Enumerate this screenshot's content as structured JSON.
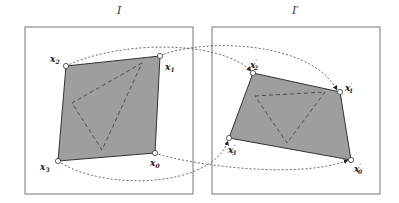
{
  "diagram": {
    "left_image": {
      "title": "I",
      "box": [
        25,
        27,
        193,
        194
      ]
    },
    "right_image": {
      "title": "I′",
      "box": [
        212,
        27,
        380,
        194
      ]
    },
    "colors": {
      "quad_fill": "#9e9e9e",
      "stroke": "#333333",
      "frame": "#777777",
      "dashed": "#444444"
    },
    "left_points": [
      {
        "label": "x",
        "sub": "0",
        "x": 155,
        "y": 153
      },
      {
        "label": "x",
        "sub": "1",
        "x": 160,
        "y": 56
      },
      {
        "label": "x",
        "sub": "2",
        "x": 66,
        "y": 66
      },
      {
        "label": "x",
        "sub": "3",
        "x": 58,
        "y": 161
      }
    ],
    "right_points": [
      {
        "label": "x",
        "sub": "0",
        "prime": true,
        "x": 351,
        "y": 160
      },
      {
        "label": "x",
        "sub": "1",
        "prime": true,
        "x": 340,
        "y": 92
      },
      {
        "label": "x",
        "sub": "2",
        "prime": true,
        "x": 253,
        "y": 73
      },
      {
        "label": "x",
        "sub": "3",
        "prime": true,
        "x": 229,
        "y": 138
      }
    ],
    "left_triangle": [
      [
        142,
        63
      ],
      [
        72,
        103
      ],
      [
        102,
        150
      ]
    ],
    "right_triangle": [
      [
        255,
        96
      ],
      [
        325,
        92
      ],
      [
        287,
        143
      ]
    ],
    "labels": {
      "x0": "x",
      "x0_sub": "0",
      "x1": "x",
      "x1_sub": "1",
      "x2": "x",
      "x2_sub": "2",
      "x3": "x",
      "x3_sub": "3",
      "prime": "′"
    }
  }
}
